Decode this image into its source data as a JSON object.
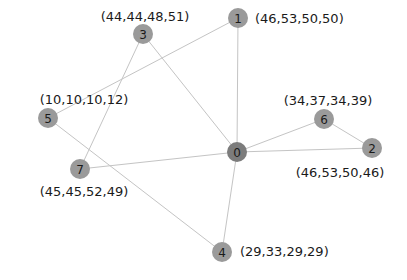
{
  "diagram": {
    "type": "graph",
    "nodes": [
      {
        "id": "0",
        "x": 237,
        "y": 152,
        "color": "#7c7c7c",
        "label": "",
        "label_x": 0,
        "label_y": 0,
        "anchor": "start"
      },
      {
        "id": "1",
        "x": 238,
        "y": 18,
        "color": "#9a9a9a",
        "label": "(46,53,50,50)",
        "label_x": 255,
        "label_y": 18,
        "anchor": "start"
      },
      {
        "id": "2",
        "x": 372,
        "y": 148,
        "color": "#9a9a9a",
        "label": "(46,53,50,46)",
        "label_x": 340,
        "label_y": 172,
        "anchor": "middle"
      },
      {
        "id": "3",
        "x": 143,
        "y": 34,
        "color": "#9a9a9a",
        "label": "(44,44,48,51)",
        "label_x": 145,
        "label_y": 16,
        "anchor": "middle"
      },
      {
        "id": "4",
        "x": 222,
        "y": 252,
        "color": "#9a9a9a",
        "label": "(29,33,29,29)",
        "label_x": 240,
        "label_y": 251,
        "anchor": "start"
      },
      {
        "id": "5",
        "x": 48,
        "y": 118,
        "color": "#9a9a9a",
        "label": "(10,10,10,12)",
        "label_x": 84,
        "label_y": 99,
        "anchor": "middle"
      },
      {
        "id": "6",
        "x": 324,
        "y": 119,
        "color": "#9a9a9a",
        "label": "(34,37,34,39)",
        "label_x": 328,
        "label_y": 100,
        "anchor": "middle"
      },
      {
        "id": "7",
        "x": 80,
        "y": 169,
        "color": "#9a9a9a",
        "label": "(45,45,52,49)",
        "label_x": 84,
        "label_y": 191,
        "anchor": "middle"
      }
    ],
    "edges": [
      [
        "0",
        "1"
      ],
      [
        "0",
        "3"
      ],
      [
        "0",
        "2"
      ],
      [
        "0",
        "6"
      ],
      [
        "0",
        "7"
      ],
      [
        "0",
        "4"
      ],
      [
        "1",
        "5"
      ],
      [
        "3",
        "7"
      ],
      [
        "5",
        "4"
      ],
      [
        "6",
        "2"
      ]
    ],
    "node_radius": 10
  }
}
